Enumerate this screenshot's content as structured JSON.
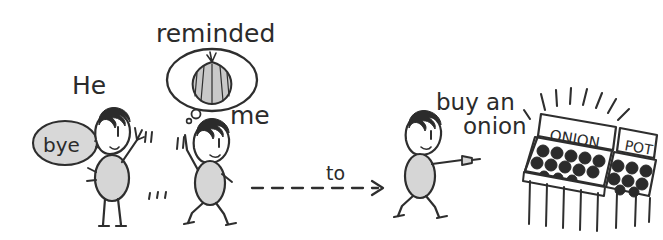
{
  "scene": {
    "title": "He reminded me to buy an onion",
    "width": 663,
    "height": 240,
    "background_color": "#ffffff",
    "ink_color": "#2e2e2e",
    "fill_gray": "#d6d6d6",
    "bubble_gray": "#d8d8d8",
    "style": "hand-drawn pencil sketch comic strip"
  },
  "texts": {
    "he": "He",
    "bye": "bye",
    "reminded": "reminded",
    "me": "me",
    "to": "to",
    "buy_an": "buy an",
    "onion": "onion"
  },
  "stall": {
    "sign_left": "ONION",
    "sign_right": "POT"
  },
  "figures": [
    {
      "name": "waving-person",
      "action": "waving goodbye"
    },
    {
      "name": "walking-person-thinking",
      "action": "walking while thinking of an onion"
    },
    {
      "name": "pointing-person",
      "action": "walking and pointing toward the stall"
    }
  ]
}
